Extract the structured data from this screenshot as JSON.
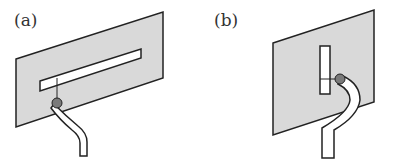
{
  "figure": {
    "panels": [
      {
        "label": "(a)",
        "description": "Ground plate with horizontal slot, coaxial feed below slot"
      },
      {
        "label": "(b)",
        "description": "Ground plate with vertical slot, coaxial feed beside slot"
      }
    ],
    "colors": {
      "plate_fill": "#d9d9d9",
      "outline": "#222222",
      "slot_fill": "#ffffff",
      "feed_dot": "#7a7a7a"
    }
  }
}
